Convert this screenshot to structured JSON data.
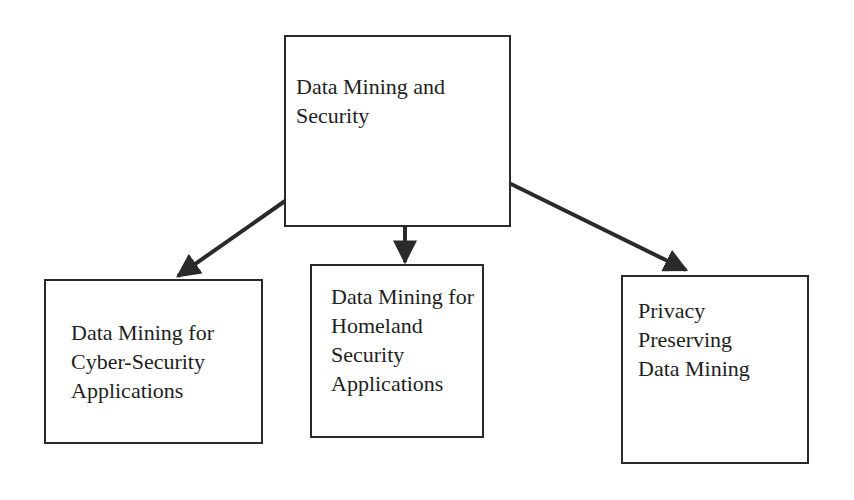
{
  "diagram": {
    "root": {
      "label": "Data Mining and\nSecurity"
    },
    "children": [
      {
        "label": "Data Mining for\nCyber-Security\nApplications"
      },
      {
        "label": "Data Mining for\nHomeland\nSecurity\nApplications"
      },
      {
        "label": "Privacy\nPreserving\nData Mining"
      }
    ],
    "edges": [
      {
        "from": "root",
        "to": "children.0"
      },
      {
        "from": "root",
        "to": "children.1"
      },
      {
        "from": "root",
        "to": "children.2"
      }
    ],
    "colors": {
      "stroke": "#2a2a2a",
      "text": "#1e1e1e",
      "background": "#ffffff"
    }
  }
}
